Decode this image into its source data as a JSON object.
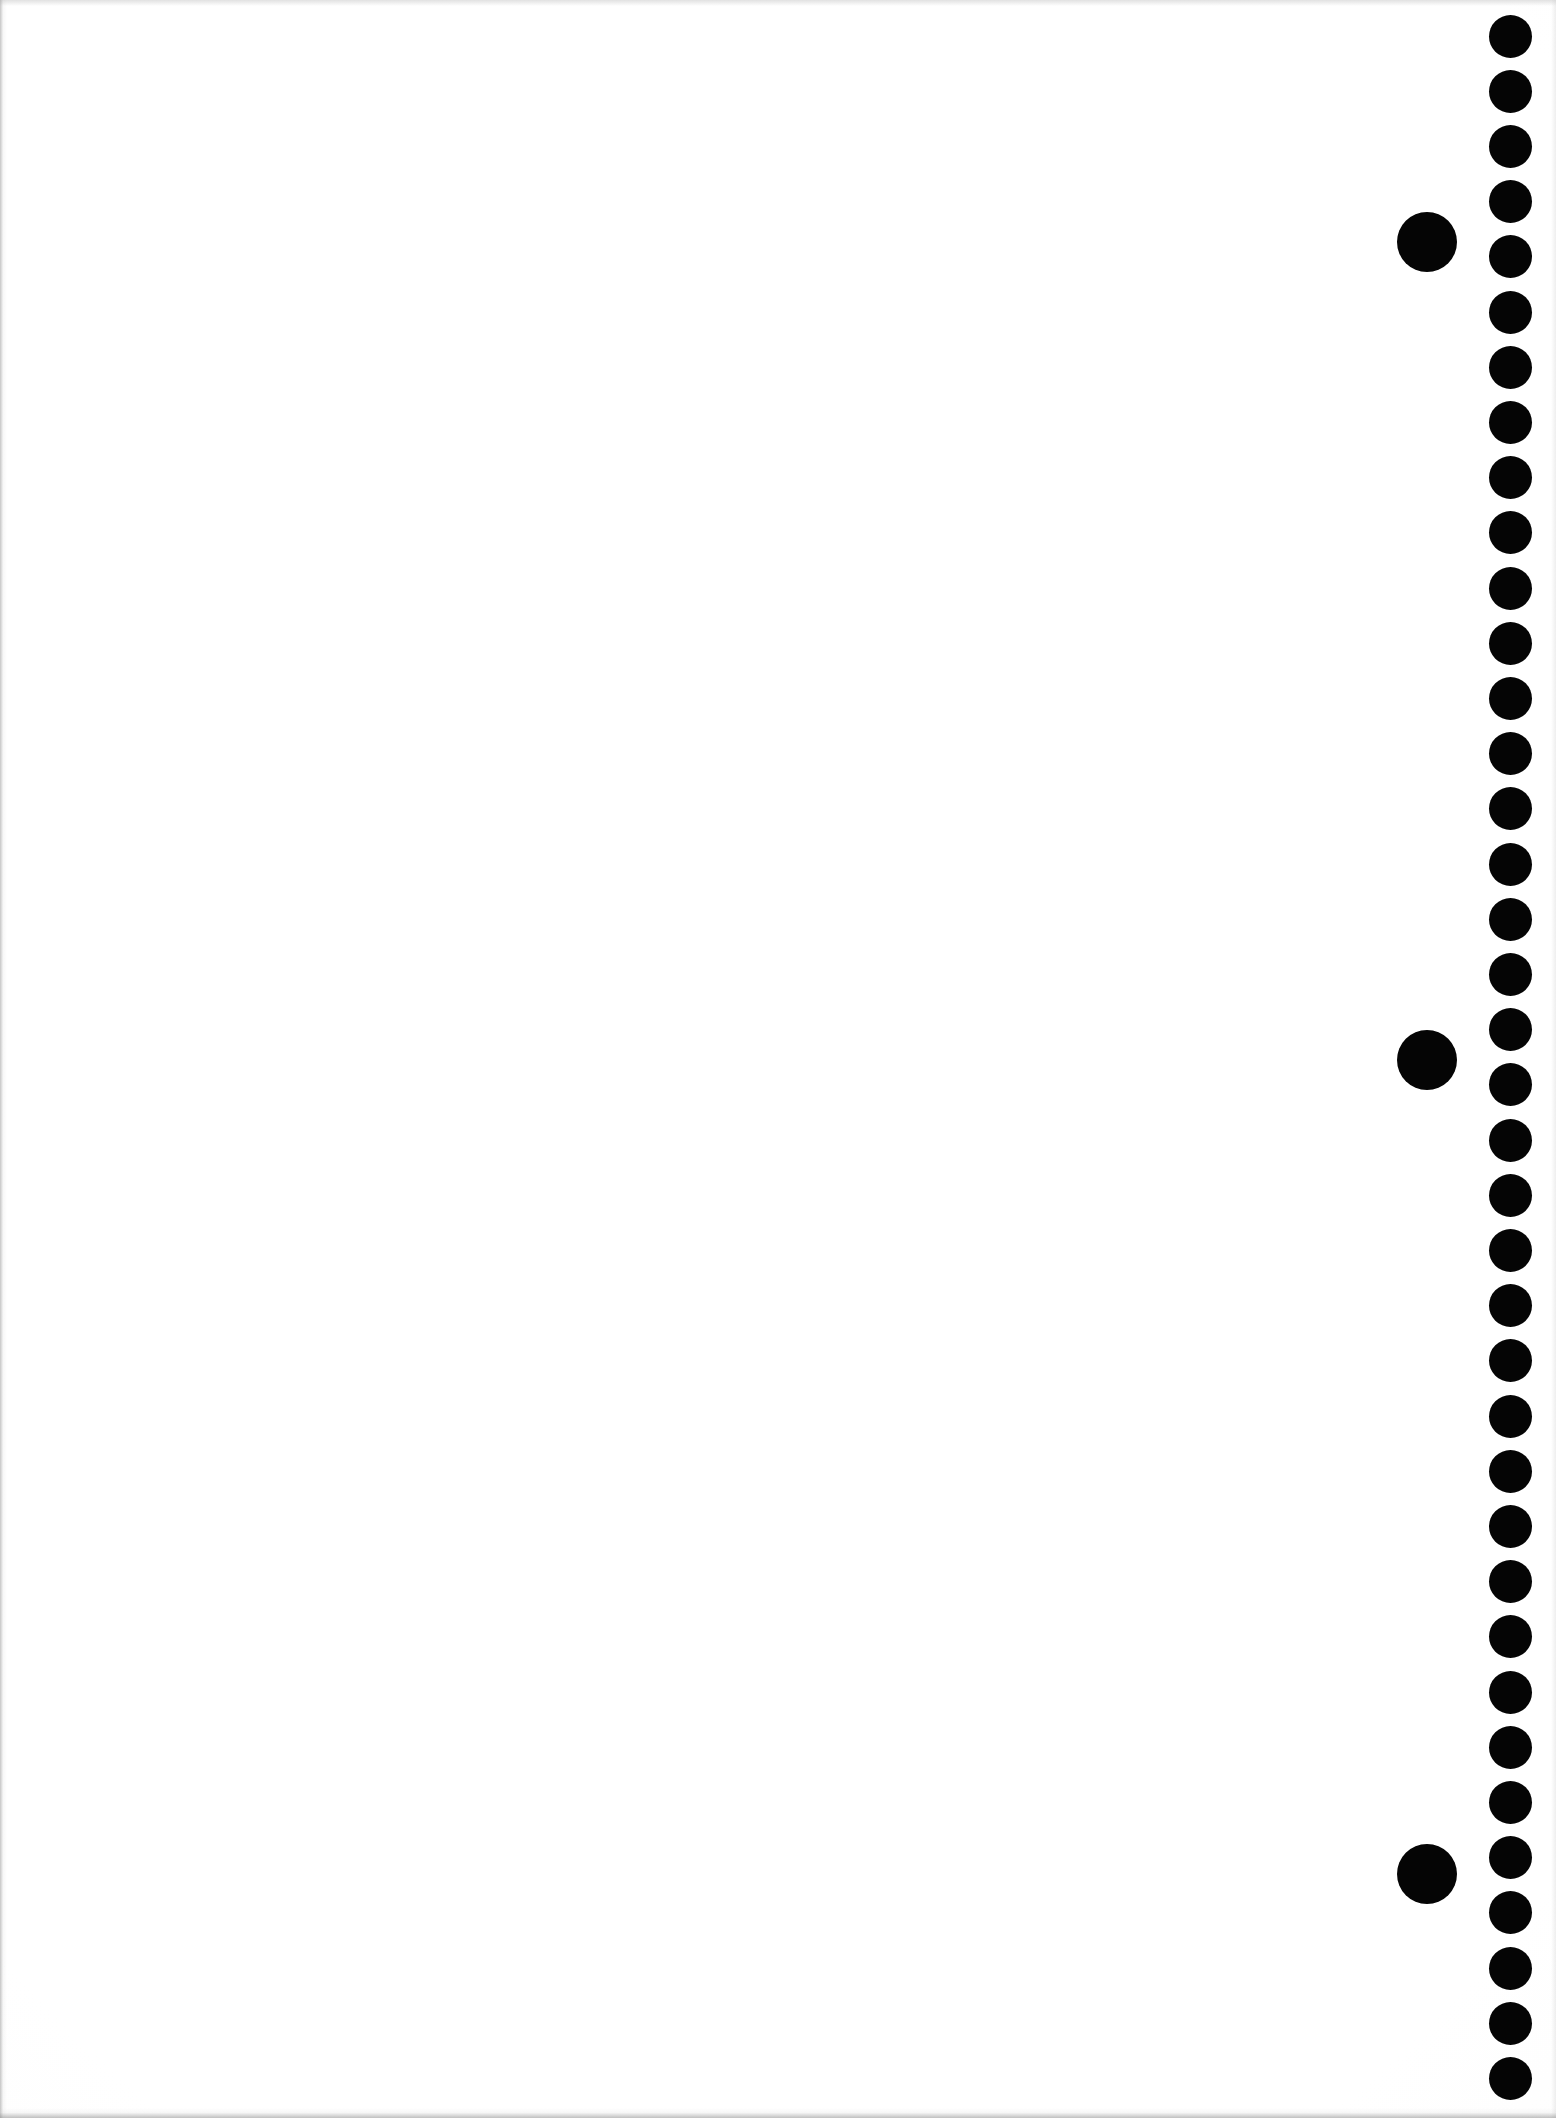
{
  "page": {
    "kind": "scanned-page",
    "width": 1556,
    "height": 2118,
    "background_color": "#fefefe",
    "ink_color": "#050505",
    "body_text": ""
  },
  "marks": {
    "register_column": {
      "label": "register-dot-column",
      "count": 38,
      "diameter": 43,
      "center_x": 1510,
      "first_center_y": 36,
      "spacing": 55.2,
      "color": "#050505"
    },
    "index_dots": {
      "label": "index-dot-column",
      "count": 3,
      "diameter": 60,
      "center_x": 1427,
      "color": "#050505",
      "centers_y": [
        242,
        1060,
        1874
      ]
    }
  }
}
